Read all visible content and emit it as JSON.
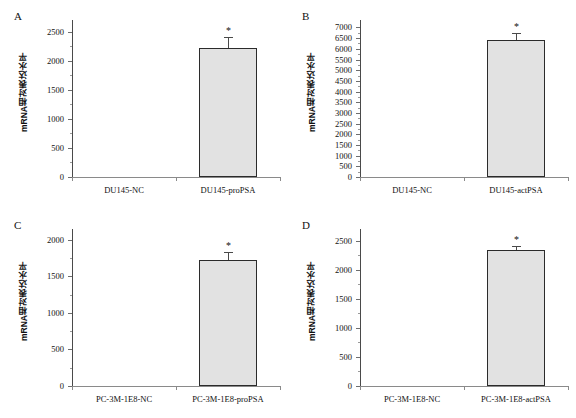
{
  "figure": {
    "ylabel": "mRNA相对表达水平",
    "significance_marker": "*",
    "bar_fill": "#e2e2e2",
    "bar_stroke": "#2b2b2b",
    "axis_color": "#6e6e6e"
  },
  "panels": [
    {
      "letter": "A",
      "chart_data": {
        "type": "bar",
        "title": "A",
        "xlabel": "",
        "ylabel": "mRNA相对表达水平",
        "categories": [
          "DU145-NC",
          "DU145-proPSA"
        ],
        "values": [
          1,
          2210
        ],
        "errors": [
          0,
          195
        ],
        "significance": [
          "",
          "*"
        ],
        "ylim": [
          0,
          2700
        ],
        "yticks": [
          0,
          500,
          1000,
          1500,
          2000,
          2500
        ],
        "yticklabels": [
          "0",
          "500",
          "1000",
          "1500",
          "2000",
          "2500"
        ],
        "grid": false,
        "legend": "none"
      }
    },
    {
      "letter": "B",
      "chart_data": {
        "type": "bar",
        "title": "B",
        "xlabel": "",
        "ylabel": "mRNA相对表达水平",
        "categories": [
          "DU145-NC",
          "DU145-actPSA"
        ],
        "values": [
          1,
          6400
        ],
        "errors": [
          0,
          330
        ],
        "significance": [
          "",
          "*"
        ],
        "ylim": [
          0,
          7350
        ],
        "yticks": [
          0,
          500,
          1000,
          1500,
          2000,
          2500,
          3000,
          3500,
          4000,
          4500,
          5000,
          5500,
          6000,
          6500,
          7000
        ],
        "yticklabels": [
          "0",
          "500",
          "1000",
          "1500",
          "2000",
          "2500",
          "3000",
          "3500",
          "4000",
          "4500",
          "5000",
          "5500",
          "6000",
          "6500",
          "7000"
        ],
        "grid": false,
        "legend": "none"
      }
    },
    {
      "letter": "C",
      "chart_data": {
        "type": "bar",
        "title": "C",
        "xlabel": "",
        "ylabel": "mRNA相对表达水平",
        "categories": [
          "PC-3M-1E8-NC",
          "PC-3M-1E8-proPSA"
        ],
        "values": [
          1,
          1720
        ],
        "errors": [
          0,
          110
        ],
        "significance": [
          "",
          "*"
        ],
        "ylim": [
          0,
          2150
        ],
        "yticks": [
          0,
          500,
          1000,
          1500,
          2000
        ],
        "yticklabels": [
          "0",
          "500",
          "1000",
          "1500",
          "2000"
        ],
        "grid": false,
        "legend": "none"
      }
    },
    {
      "letter": "D",
      "chart_data": {
        "type": "bar",
        "title": "D",
        "xlabel": "",
        "ylabel": "mRNA相对表达水平",
        "categories": [
          "PC-3M-1E8-NC",
          "PC-3M-1E8-actPSA"
        ],
        "values": [
          1,
          2340
        ],
        "errors": [
          0,
          75
        ],
        "significance": [
          "",
          "*"
        ],
        "ylim": [
          0,
          2700
        ],
        "yticks": [
          0,
          500,
          1000,
          1500,
          2000,
          2500
        ],
        "yticklabels": [
          "0",
          "500",
          "1000",
          "1500",
          "2000",
          "2500"
        ],
        "grid": false,
        "legend": "none"
      }
    }
  ]
}
